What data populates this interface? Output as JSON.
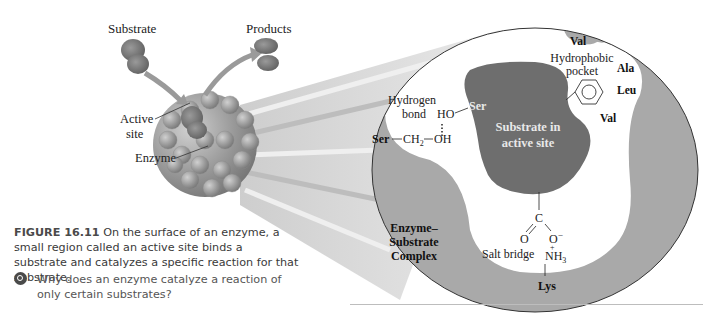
{
  "figure": {
    "labels": {
      "substrate": "Substrate",
      "products": "Products",
      "active_site_line1": "Active",
      "active_site_line2": "site",
      "enzyme": "Enzyme"
    },
    "detail": {
      "hydrogen_bond_line1": "Hydrogen",
      "hydrogen_bond_line2": "bond",
      "ser_bottom": "Ser",
      "ch2": "CH",
      "ch2_sub": "2",
      "oh": "OH",
      "ho": "HO",
      "ser_top": "Ser",
      "substrate_line1": "Substrate in",
      "substrate_line2": "active site",
      "hydrophobic_line1": "Hydrophobic",
      "hydrophobic_line2": "pocket",
      "val_top": "Val",
      "ala": "Ala",
      "leu": "Leu",
      "val_mid": "Val",
      "complex_line1": "Enzyme–",
      "complex_line2": "Substrate",
      "complex_line3": "Complex",
      "carbon": "C",
      "o_left": "O",
      "o_right": "O",
      "o_charge": "−",
      "nh3": "NH",
      "nh3_sub": "3",
      "nh3_charge": "+",
      "salt_bridge": "Salt bridge",
      "lys": "Lys"
    },
    "colors": {
      "enzyme_gray": "#a9a9a9",
      "substrate_dark": "#6e6e6e",
      "beam": "#d8d8d8"
    }
  },
  "caption": {
    "label": "FIGURE 16.11",
    "text": " On the surface of an enzyme, a small region called an active site binds a substrate and catalyzes a specific reaction for that substrate."
  },
  "question": {
    "text": "Why does an enzyme catalyze a reaction of only certain substrates?"
  }
}
